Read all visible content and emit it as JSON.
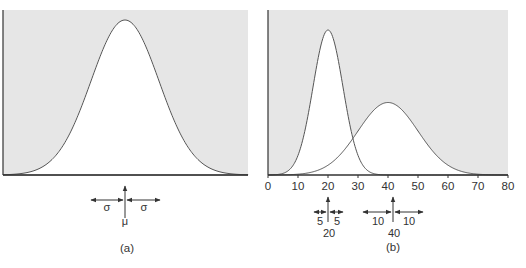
{
  "figure": {
    "panel_a": {
      "caption": "(a)",
      "mean_label": "μ",
      "sigma_left_label": "σ",
      "sigma_right_label": "σ"
    },
    "panel_b": {
      "caption": "(b)",
      "x_ticks": [
        "0",
        "10",
        "20",
        "30",
        "40",
        "50",
        "60",
        "70",
        "80"
      ],
      "peak1": {
        "mean_label": "20",
        "sd_left_label": "5",
        "sd_right_label": "5"
      },
      "peak2": {
        "mean_label": "40",
        "sd_left_label": "10",
        "sd_right_label": "10"
      }
    },
    "colors": {
      "background_shade": "#e6e6e6",
      "curve": "#555555",
      "axis": "#333333"
    }
  },
  "chart_data": [
    {
      "type": "area",
      "title": "(a)",
      "description": "Normal distribution with mean μ and standard deviation σ",
      "series": [
        {
          "name": "Normal(μ, σ)",
          "mean": "μ",
          "sd": "σ"
        }
      ],
      "xlabel": "",
      "ylabel": "",
      "annotations": [
        "μ",
        "σ",
        "σ"
      ],
      "grid": false
    },
    {
      "type": "area",
      "title": "(b)",
      "description": "Two normal distributions: mean 20 sd 5, and mean 40 sd 10",
      "x_ticks": [
        0,
        10,
        20,
        30,
        40,
        50,
        60,
        70,
        80
      ],
      "xlim": [
        0,
        80
      ],
      "series": [
        {
          "name": "Normal(20, 5)",
          "mean": 20,
          "sd": 5,
          "relative_peak": 1.0
        },
        {
          "name": "Normal(40, 10)",
          "mean": 40,
          "sd": 10,
          "relative_peak": 0.5
        }
      ],
      "annotations": [
        "5",
        "5",
        "20",
        "10",
        "10",
        "40"
      ],
      "grid": false
    }
  ]
}
